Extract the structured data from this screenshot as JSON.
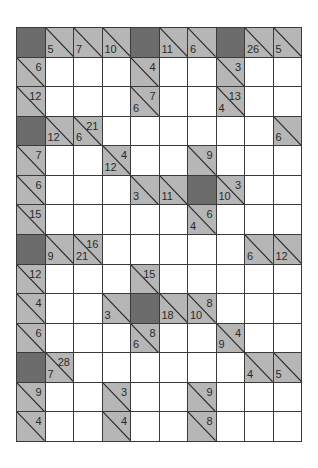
{
  "puzzle": {
    "type": "kakuro",
    "rows": 14,
    "cols": 10,
    "legend": {
      "D": "dark block",
      "W": "empty white cell",
      "C": "clue cell [down, across]"
    },
    "colors": {
      "dark": "#6c6c6c",
      "clue": "#b6b6b6",
      "white": "#ffffff",
      "grid_line": "#3a3a3a",
      "text": "#2a2a2a"
    },
    "grid": [
      [
        "D",
        {
          "d": "5"
        },
        {
          "d": "7"
        },
        {
          "d": "10"
        },
        "D",
        {
          "d": "11"
        },
        {
          "d": "6"
        },
        "D",
        {
          "d": "26"
        },
        {
          "d": "5"
        }
      ],
      [
        {
          "a": "6"
        },
        "W",
        "W",
        "W",
        {
          "a": "4"
        },
        "W",
        "W",
        {
          "a": "3"
        },
        "W",
        "W"
      ],
      [
        {
          "a": "12"
        },
        "W",
        "W",
        "W",
        {
          "d": "6",
          "a": "7"
        },
        "W",
        "W",
        {
          "d": "4",
          "a": "13"
        },
        "W",
        "W"
      ],
      [
        "D",
        {
          "d": "12"
        },
        {
          "d": "6",
          "a": "21"
        },
        "W",
        "W",
        "W",
        "W",
        "W",
        "W",
        {
          "d": "6"
        }
      ],
      [
        {
          "a": "7"
        },
        "W",
        "W",
        {
          "d": "12",
          "a": "4"
        },
        "W",
        "W",
        {
          "a": "9"
        },
        "W",
        "W",
        "W"
      ],
      [
        {
          "a": "6"
        },
        "W",
        "W",
        "W",
        {
          "d": "3"
        },
        {
          "d": "11"
        },
        "D",
        {
          "d": "10",
          "a": "3"
        },
        "W",
        "W"
      ],
      [
        {
          "a": "15"
        },
        "W",
        "W",
        "W",
        "W",
        "W",
        {
          "d": "4",
          "a": "6"
        },
        "W",
        "W",
        "W"
      ],
      [
        "D",
        {
          "d": "9"
        },
        {
          "d": "21",
          "a": "16"
        },
        "W",
        "W",
        "W",
        "W",
        "W",
        {
          "d": "6"
        },
        {
          "d": "12"
        }
      ],
      [
        {
          "a": "12"
        },
        "W",
        "W",
        "W",
        {
          "a": "15"
        },
        "W",
        "W",
        "W",
        "W",
        "W"
      ],
      [
        {
          "a": "4"
        },
        "W",
        "W",
        {
          "d": "3"
        },
        "D",
        {
          "d": "18"
        },
        {
          "d": "10",
          "a": "8"
        },
        "W",
        "W",
        "W"
      ],
      [
        {
          "a": "6"
        },
        "W",
        "W",
        "W",
        {
          "d": "6",
          "a": "8"
        },
        "W",
        "W",
        {
          "d": "9",
          "a": "4"
        },
        "W",
        "W"
      ],
      [
        "D",
        {
          "d": "7",
          "a": "28"
        },
        "W",
        "W",
        "W",
        "W",
        "W",
        "W",
        {
          "d": "4"
        },
        {
          "d": "5"
        }
      ],
      [
        {
          "a": "9"
        },
        "W",
        "W",
        {
          "a": "3"
        },
        "W",
        "W",
        {
          "a": "9"
        },
        "W",
        "W",
        "W"
      ],
      [
        {
          "a": "4"
        },
        "W",
        "W",
        {
          "a": "4"
        },
        "W",
        "W",
        {
          "a": "8"
        },
        "W",
        "W",
        "W"
      ]
    ]
  }
}
